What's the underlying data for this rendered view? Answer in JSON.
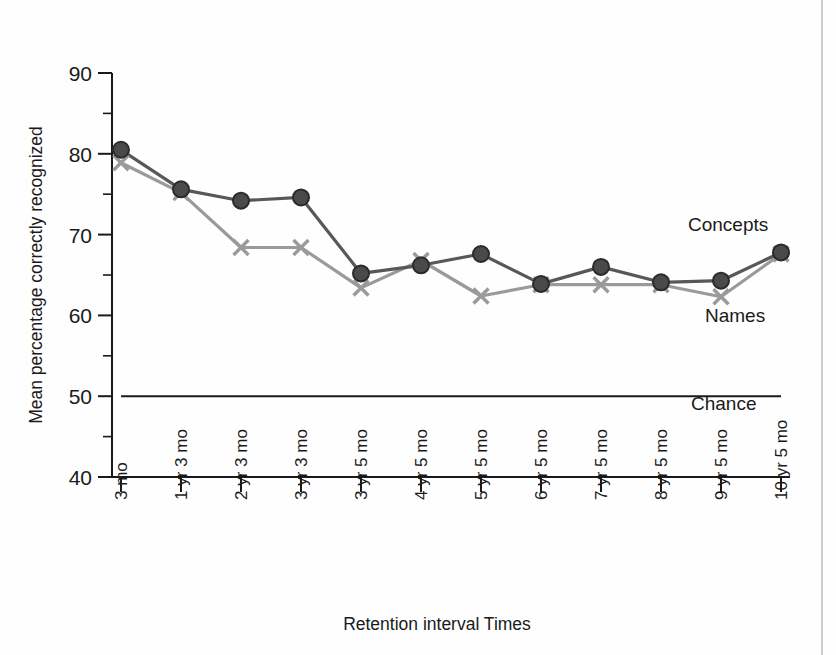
{
  "chart_data": {
    "type": "line",
    "title": "",
    "xlabel": "Retention interval Times",
    "ylabel": "Mean percentage correctly recognized",
    "ylim": [
      40,
      90
    ],
    "y_ticks": [
      40,
      50,
      60,
      70,
      80,
      90
    ],
    "y_minor_ticks": [
      45,
      55,
      65,
      75,
      85
    ],
    "grid": false,
    "legend_position": "inline-right",
    "categories": [
      "3 mo",
      "1 yr 3 mo",
      "2 yr 3 mo",
      "3 yr 3 mo",
      "3 yr 5 mo",
      "4 yr 5 mo",
      "5 yr 5 mo",
      "6 yr 5 mo",
      "7 yr 5 mo",
      "8 yr 5 mo",
      "9 yr 5 mo",
      "10 yr 5 mo"
    ],
    "series": [
      {
        "name": "Concepts",
        "marker": "circle",
        "color": "#4a4a4a",
        "values": [
          80.5,
          75.6,
          74.2,
          74.6,
          65.2,
          66.2,
          67.6,
          63.9,
          66.0,
          64.1,
          64.3,
          67.8
        ]
      },
      {
        "name": "Names",
        "marker": "x",
        "color": "#9a9a9a",
        "values": [
          78.9,
          75.2,
          68.4,
          68.4,
          63.4,
          66.8,
          62.4,
          63.8,
          63.8,
          63.8,
          62.3,
          67.6
        ]
      }
    ],
    "annotations": [
      {
        "label": "Concepts",
        "kind": "series-label"
      },
      {
        "label": "Names",
        "kind": "series-label"
      },
      {
        "label": "Chance",
        "kind": "reference-line-label",
        "value": 50
      }
    ],
    "reference_lines": [
      {
        "label": "Chance",
        "y": 50
      }
    ]
  }
}
